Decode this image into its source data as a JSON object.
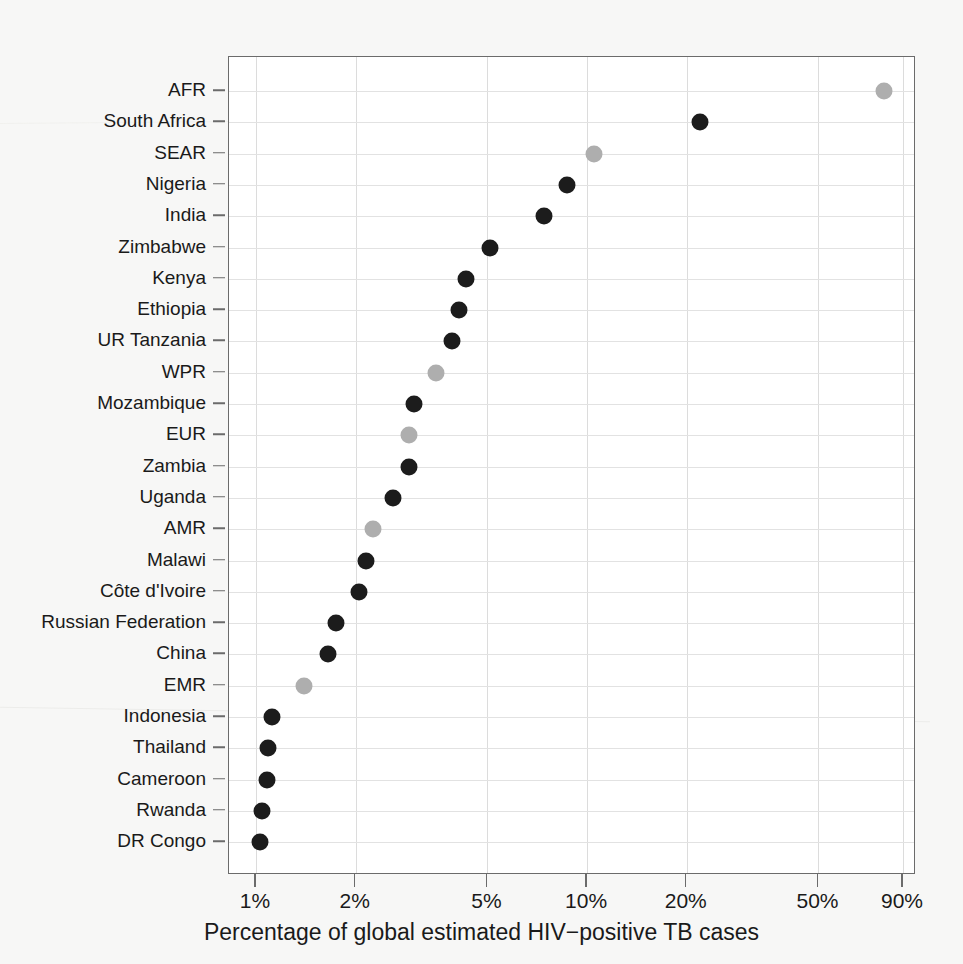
{
  "figure": {
    "background_color": "#f7f7f6",
    "plot_background_color": "#ffffff",
    "frame_color": "#6b6b6b",
    "grid_color": "#dcdcdc",
    "dark_marker_color": "#1c1c1c",
    "light_marker_color": "#aeaeae"
  },
  "chart_data": {
    "type": "scatter",
    "title": "",
    "xlabel": "Percentage of global estimated HIV−positive TB cases",
    "ylabel": "",
    "x_scale": "log",
    "grid": true,
    "legend": "none",
    "xlim": [
      0.9,
      95
    ],
    "x_tick_labels": [
      "1%",
      "2%",
      "5%",
      "10%",
      "20%",
      "50%",
      "90%"
    ],
    "x_tick_values": [
      1,
      2,
      5,
      10,
      20,
      50,
      90
    ],
    "categories": [
      "AFR",
      "South Africa",
      "SEAR",
      "Nigeria",
      "India",
      "Zimbabwe",
      "Kenya",
      "Ethiopia",
      "UR Tanzania",
      "WPR",
      "Mozambique",
      "EUR",
      "Zambia",
      "Uganda",
      "AMR",
      "Malawi",
      "Côte d'Ivoire",
      "Russian Federation",
      "China",
      "EMR",
      "Indonesia",
      "Thailand",
      "Cameroon",
      "Rwanda",
      "DR Congo"
    ],
    "values": [
      79,
      22,
      10.5,
      8.7,
      7.4,
      5.1,
      4.3,
      4.1,
      3.9,
      3.5,
      3.0,
      2.9,
      2.9,
      2.6,
      2.25,
      2.15,
      2.05,
      1.75,
      1.65,
      1.4,
      1.12,
      1.09,
      1.08,
      1.04,
      1.03
    ],
    "marker_kinds": [
      "light",
      "dark",
      "light",
      "dark",
      "dark",
      "dark",
      "dark",
      "dark",
      "dark",
      "light",
      "dark",
      "light",
      "dark",
      "dark",
      "light",
      "dark",
      "dark",
      "dark",
      "dark",
      "light",
      "dark",
      "dark",
      "dark",
      "dark",
      "dark"
    ]
  }
}
